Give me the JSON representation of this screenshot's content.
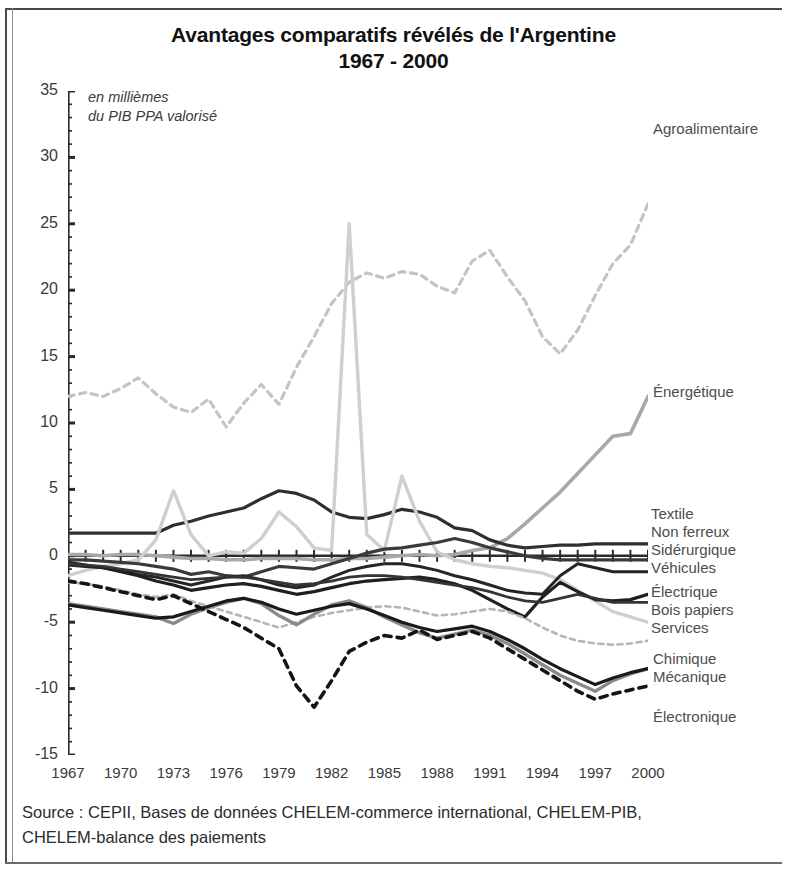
{
  "title": {
    "line1": "Avantages comparatifs révélés de l'Argentine",
    "line2": "1967 - 2000"
  },
  "unit_note": {
    "line1": "en millièmes",
    "line2": "du PIB PPA valorisé"
  },
  "source_note": {
    "line1": "Source : CEPII, Bases de données CHELEM-commerce international, CHELEM-PIB,",
    "line2": "CHELEM-balance des paiements"
  },
  "chart_data": {
    "type": "line",
    "title": "Avantages comparatifs révélés de l'Argentine 1967 - 2000",
    "subtitle": "1967 - 2000",
    "xlabel": "",
    "ylabel": "en millièmes du PIB PPA valorisé",
    "xlim": [
      1967,
      2000
    ],
    "ylim": [
      -15,
      35
    ],
    "yticks": [
      35,
      30,
      25,
      20,
      15,
      10,
      5,
      0,
      -5,
      -10,
      -15
    ],
    "xticks": [
      1967,
      1970,
      1973,
      1976,
      1979,
      1982,
      1985,
      1988,
      1991,
      1994,
      1997,
      2000
    ],
    "grid": false,
    "legend_position": "right-inline-labels",
    "x": [
      1967,
      1968,
      1969,
      1970,
      1971,
      1972,
      1973,
      1974,
      1975,
      1976,
      1977,
      1978,
      1979,
      1980,
      1981,
      1982,
      1983,
      1984,
      1985,
      1986,
      1987,
      1988,
      1989,
      1990,
      1991,
      1992,
      1993,
      1994,
      1995,
      1996,
      1997,
      1998,
      1999,
      2000
    ],
    "series": [
      {
        "name": "Agroalimentaire",
        "color": "#c4c4c4",
        "style": "dashed",
        "width": 3.2,
        "label_y": 31.6,
        "values": [
          12.0,
          12.3,
          12.0,
          12.6,
          13.4,
          12.2,
          11.2,
          10.8,
          11.8,
          9.7,
          11.5,
          12.9,
          11.4,
          14.2,
          16.5,
          19.0,
          20.6,
          21.3,
          20.9,
          21.4,
          21.2,
          20.3,
          19.8,
          22.2,
          23.0,
          21.0,
          19.2,
          16.5,
          15.2,
          17.0,
          19.6,
          22.0,
          23.4,
          26.5
        ]
      },
      {
        "name": "Énergétique",
        "color": "#a8a8a8",
        "style": "solid",
        "width": 3.6,
        "label_y": 12.0,
        "values": [
          0.1,
          0.1,
          0.0,
          0.1,
          0.1,
          0.0,
          -0.1,
          -0.2,
          -0.2,
          -0.3,
          -0.3,
          -0.2,
          -0.2,
          -0.2,
          -0.3,
          -0.3,
          -0.2,
          -0.2,
          -0.1,
          0.0,
          0.1,
          0.0,
          0.1,
          0.4,
          0.6,
          1.3,
          2.4,
          3.6,
          4.8,
          6.2,
          7.6,
          9.0,
          9.2,
          12.0
        ]
      },
      {
        "name": "Textile",
        "color": "#2f2f2f",
        "style": "solid",
        "width": 3.2,
        "label_y": 1.7,
        "values": [
          1.7,
          1.7,
          1.7,
          1.7,
          1.7,
          1.7,
          2.3,
          2.6,
          3.0,
          3.3,
          3.6,
          4.3,
          4.9,
          4.7,
          4.2,
          3.3,
          2.9,
          2.8,
          3.1,
          3.5,
          3.3,
          2.9,
          2.1,
          1.9,
          1.2,
          0.8,
          0.6,
          0.7,
          0.8,
          0.8,
          0.9,
          0.9,
          0.9,
          0.9
        ]
      },
      {
        "name": "Non ferreux",
        "color": "#cfcfcf",
        "style": "solid",
        "width": 3.4,
        "label_y": 0.7,
        "values": [
          -1.5,
          -1.1,
          -0.8,
          -0.6,
          -0.3,
          1.2,
          4.9,
          1.6,
          0.0,
          0.3,
          0.2,
          1.3,
          3.3,
          2.2,
          0.6,
          0.4,
          25.0,
          1.6,
          0.4,
          6.0,
          2.6,
          0.3,
          -0.3,
          -0.6,
          -0.8,
          -0.9,
          -1.1,
          -1.3,
          -1.8,
          -2.6,
          -3.4,
          -4.2,
          -4.6,
          -5.0
        ]
      },
      {
        "name": "Sidérurgique",
        "color": "#3a3a3a",
        "style": "solid",
        "width": 3.2,
        "label_y": -0.3,
        "values": [
          -0.3,
          -0.3,
          -0.4,
          -0.5,
          -0.6,
          -0.8,
          -1.0,
          -1.4,
          -1.2,
          -1.5,
          -1.6,
          -1.2,
          -0.8,
          -0.9,
          -1.0,
          -0.6,
          -0.2,
          0.2,
          0.5,
          0.6,
          0.8,
          1.0,
          1.3,
          1.0,
          0.6,
          0.3,
          0.0,
          -0.2,
          -0.3,
          -0.3,
          -0.3,
          -0.3,
          -0.3,
          -0.3
        ]
      },
      {
        "name": "Véhicules",
        "color": "#252525",
        "style": "solid",
        "width": 3.0,
        "label_y": -1.2,
        "values": [
          -0.7,
          -0.8,
          -0.9,
          -1.1,
          -1.4,
          -1.6,
          -1.9,
          -2.2,
          -1.9,
          -1.6,
          -1.5,
          -1.8,
          -2.2,
          -2.4,
          -2.2,
          -1.6,
          -1.1,
          -0.8,
          -0.6,
          -0.6,
          -0.8,
          -1.1,
          -1.5,
          -1.8,
          -2.2,
          -2.6,
          -2.8,
          -2.9,
          -1.5,
          -0.6,
          -0.9,
          -1.2,
          -1.2,
          -1.2
        ]
      },
      {
        "name": "Électrique",
        "color": "#1f1f1f",
        "style": "solid",
        "width": 3.2,
        "label_y": -2.9,
        "values": [
          -0.5,
          -0.7,
          -0.9,
          -1.2,
          -1.5,
          -1.9,
          -2.2,
          -2.6,
          -2.4,
          -2.2,
          -2.1,
          -2.3,
          -2.6,
          -2.9,
          -2.7,
          -2.4,
          -2.1,
          -1.9,
          -1.8,
          -1.7,
          -1.6,
          -1.8,
          -2.1,
          -2.6,
          -3.3,
          -4.0,
          -4.6,
          -3.1,
          -2.0,
          -2.7,
          -3.3,
          -3.4,
          -3.3,
          -2.9
        ]
      },
      {
        "name": "Bois papiers",
        "color": "#343434",
        "style": "solid",
        "width": 2.8,
        "label_y": -3.5,
        "values": [
          -0.6,
          -0.7,
          -0.8,
          -1.0,
          -1.2,
          -1.4,
          -1.6,
          -1.8,
          -1.7,
          -1.6,
          -1.6,
          -1.8,
          -2.0,
          -2.2,
          -2.1,
          -1.9,
          -1.6,
          -1.5,
          -1.5,
          -1.6,
          -1.8,
          -2.0,
          -2.2,
          -2.4,
          -2.7,
          -3.1,
          -3.4,
          -3.5,
          -3.2,
          -2.9,
          -3.2,
          -3.5,
          -3.5,
          -3.5
        ]
      },
      {
        "name": "Services",
        "color": "#b5b5b5",
        "style": "dashed",
        "width": 2.6,
        "label_y": -4.2,
        "values": [
          -2.0,
          -2.1,
          -2.3,
          -2.6,
          -2.9,
          -3.1,
          -2.9,
          -3.4,
          -3.8,
          -4.2,
          -4.6,
          -5.0,
          -5.4,
          -5.0,
          -4.6,
          -4.3,
          -4.1,
          -3.9,
          -3.8,
          -3.9,
          -4.2,
          -4.5,
          -4.4,
          -4.2,
          -4.0,
          -4.2,
          -4.7,
          -5.4,
          -6.0,
          -6.4,
          -6.6,
          -6.7,
          -6.6,
          -6.4
        ]
      },
      {
        "name": "Chimique",
        "color": "#8a8a8a",
        "style": "solid",
        "width": 3.4,
        "label_y": -7.4,
        "values": [
          -3.6,
          -3.8,
          -4.0,
          -4.2,
          -4.4,
          -4.6,
          -5.1,
          -4.4,
          -3.9,
          -3.5,
          -3.2,
          -3.6,
          -4.5,
          -5.2,
          -4.4,
          -3.7,
          -3.4,
          -3.9,
          -4.6,
          -5.2,
          -5.8,
          -6.2,
          -5.9,
          -5.6,
          -6.0,
          -6.6,
          -7.4,
          -8.2,
          -9.0,
          -9.6,
          -10.2,
          -9.4,
          -8.9,
          -8.5
        ]
      },
      {
        "name": "Mécanique",
        "color": "#1a1a1a",
        "style": "solid",
        "width": 3.2,
        "label_y": -8.6,
        "values": [
          -3.7,
          -3.9,
          -4.1,
          -4.3,
          -4.5,
          -4.7,
          -4.6,
          -4.2,
          -3.8,
          -3.4,
          -3.2,
          -3.5,
          -4.0,
          -4.4,
          -4.1,
          -3.8,
          -3.6,
          -4.0,
          -4.5,
          -5.0,
          -5.4,
          -5.7,
          -5.5,
          -5.3,
          -5.7,
          -6.3,
          -7.0,
          -7.8,
          -8.5,
          -9.1,
          -9.7,
          -9.2,
          -8.8,
          -8.5
        ]
      },
      {
        "name": "Électronique",
        "color": "#141414",
        "style": "dashed",
        "width": 3.6,
        "label_y": -11.5,
        "values": [
          -1.9,
          -2.1,
          -2.4,
          -2.7,
          -3.0,
          -3.3,
          -3.0,
          -3.6,
          -4.2,
          -4.8,
          -5.4,
          -6.2,
          -7.0,
          -9.8,
          -11.4,
          -9.4,
          -7.2,
          -6.5,
          -6.0,
          -6.2,
          -5.6,
          -6.3,
          -6.0,
          -5.7,
          -6.2,
          -7.0,
          -7.8,
          -8.6,
          -9.4,
          -10.2,
          -10.8,
          -10.4,
          -10.1,
          -9.8
        ]
      }
    ]
  },
  "series_labels": [
    {
      "name": "Agroalimentaire",
      "top": 120,
      "left": 653
    },
    {
      "name": "Énergétique",
      "top": 383,
      "left": 653
    },
    {
      "name": "Textile",
      "top": 505,
      "left": 651
    },
    {
      "name": "Non ferreux",
      "top": 523,
      "left": 651
    },
    {
      "name": "Sidérurgique",
      "top": 541,
      "left": 651
    },
    {
      "name": "Véhicules",
      "top": 559,
      "left": 651
    },
    {
      "name": "Électrique",
      "top": 583,
      "left": 651
    },
    {
      "name": "Bois papiers",
      "top": 601,
      "left": 651
    },
    {
      "name": "Services",
      "top": 619,
      "left": 651
    },
    {
      "name": "Chimique",
      "top": 650,
      "left": 653
    },
    {
      "name": "Mécanique",
      "top": 668,
      "left": 653
    },
    {
      "name": "Électronique",
      "top": 708,
      "left": 653
    }
  ]
}
